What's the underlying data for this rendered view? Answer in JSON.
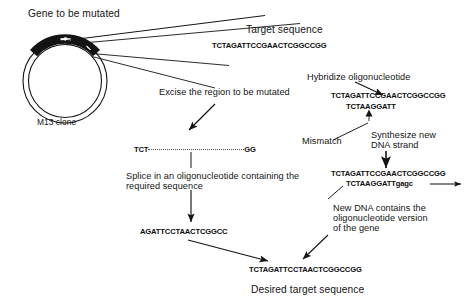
{
  "figure": {
    "background_color": "#ffffff",
    "ink_color": "#141414"
  },
  "labels": {
    "gene_to_be_mutated": "Gene to be mutated",
    "m13_clone": "M13 clone",
    "target_sequence": "Target sequence",
    "excise_region": "Excise the region to be mutated",
    "hybridize_oligonucleotide": "Hybridize oligonucleotide",
    "mismatch": "Mismatch",
    "synthesize_new_dna_strand_line1": "Synthesize new",
    "synthesize_new_dna_strand_line2": "DNA strand",
    "splice_line1": "Splice in an oligonucleotide containing the",
    "splice_line2": "required sequence",
    "new_dna_line1": "New DNA contains the",
    "new_dna_line2": "oligonucleotide version",
    "new_dna_line3": "of the gene",
    "desired_target_sequence": "Desired target sequence"
  },
  "sequences": {
    "target": "TCTAGATTCCGAACTCGGCCGG",
    "excised_prefix": "TCT",
    "excised_dots": "..................................",
    "excised_suffix": "GG",
    "hybridized_top": "TCTAGATTCCGAACTCGGCCGG",
    "hybridized_oligo": "TCTAAGGATT",
    "synthesized_top": "TCTAGATTCCGAACTCGGCCGG",
    "synthesized_bottom": "TCTAAGGATTgagc",
    "spliced_oligo": "AGATTCCTAACTCGGCC",
    "final_product": "TCTAGATTCCTAACTCGGCCGG"
  }
}
